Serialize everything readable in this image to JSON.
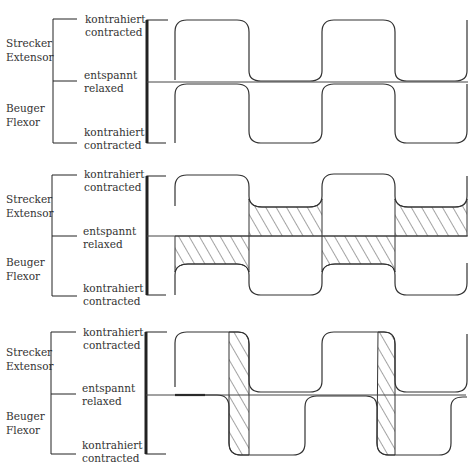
{
  "panels": [
    {
      "id": "panel-1",
      "description": "Ideal reciprocal alternation: extensor and flexor contract in strict alternation",
      "muscle_labels": {
        "upper": [
          "Strecker",
          "Extensor"
        ],
        "lower": [
          "Beuger",
          "Flexor"
        ]
      },
      "level_labels": {
        "top": [
          "kontrahiert",
          "contracted"
        ],
        "middle": [
          "entspannt",
          "relaxed"
        ],
        "bottom": [
          "kontrahiert",
          "contracted"
        ]
      },
      "pattern": "alternating",
      "hatching": "none"
    },
    {
      "id": "panel-2",
      "description": "Co-contraction: the antagonist does not fully relax (hatched residual tension)",
      "muscle_labels": {
        "upper": [
          "Strecker",
          "Extensor"
        ],
        "lower": [
          "Beuger",
          "Flexor"
        ]
      },
      "level_labels": {
        "top": [
          "kontrahiert",
          "contracted"
        ],
        "middle": [
          "entspannt",
          "relaxed"
        ],
        "bottom": [
          "kontrahiert",
          "contracted"
        ]
      },
      "pattern": "alternating-with-residual-tone",
      "hatching": "residual-tone"
    },
    {
      "id": "panel-3",
      "description": "Overlap: antagonist contracts before agonist has relaxed (hatched overlap)",
      "muscle_labels": {
        "upper": [
          "Strecker",
          "Extensor"
        ],
        "lower": [
          "Beuger",
          "Flexor"
        ]
      },
      "level_labels": {
        "top": [
          "kontrahiert",
          "contracted"
        ],
        "middle": [
          "entspannt",
          "relaxed"
        ],
        "bottom": [
          "kontrahiert",
          "contracted"
        ]
      },
      "pattern": "alternating-with-overlap",
      "hatching": "overlap-strips"
    }
  ],
  "colors": {
    "ink": "#333333",
    "background": "#ffffff"
  }
}
